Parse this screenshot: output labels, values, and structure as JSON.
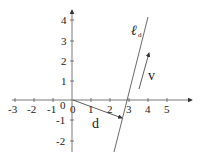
{
  "diagram": {
    "x_axis": {
      "ticks": [
        "-3",
        "-2",
        "-1",
        "0",
        "1",
        "2",
        "3",
        "4",
        "5"
      ]
    },
    "y_axis": {
      "ticks": [
        "-2",
        "-1",
        "1",
        "2",
        "3",
        "4"
      ],
      "origin_label": "0"
    },
    "line_label": {
      "main": "ℓ",
      "sub": "d"
    },
    "vector_d_label": "d",
    "vector_v_label": "v",
    "colors": {
      "stroke": "#333333",
      "text": "#222222",
      "background": "#ffffff"
    }
  }
}
